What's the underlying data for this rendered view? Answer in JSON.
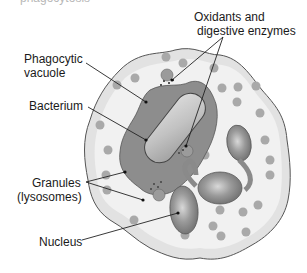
{
  "figure": {
    "cut_title": "phagocytosis",
    "colors": {
      "cytoplasm_outer": "#e2e2e2",
      "cytoplasm_inner": "#f1f1f1",
      "membrane": "#555555",
      "vacuole": "#8d8d8d",
      "bacterium": "#bdbdbd",
      "nucleus": "#8a8a8a",
      "granule": "#a9a9a9",
      "leader_line": "#222222"
    }
  },
  "labels": {
    "oxidants_line1": "Oxidants and",
    "oxidants_line2": "digestive enzymes",
    "vacuole_line1": "Phagocytic",
    "vacuole_line2": "vacuole",
    "bacterium": "Bacterium",
    "granules_line1": "Granules",
    "granules_line2": "(lysosomes)",
    "nucleus": "Nucleus"
  }
}
